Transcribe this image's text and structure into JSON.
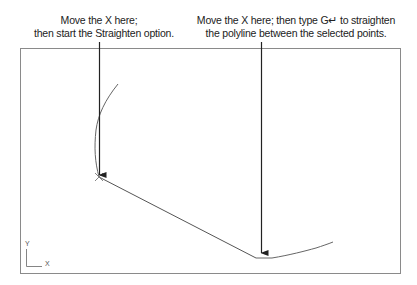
{
  "callouts": {
    "left": {
      "line1": "Move the X here;",
      "line2": "then start the Straighten option."
    },
    "right": {
      "line1": "Move the X here; then type G↵ to straighten",
      "line2": "the polyline between the selected points."
    }
  },
  "ucs_icon": {
    "y_label": "Y",
    "x_label": "X"
  },
  "colors": {
    "frame": "#8a8a8a",
    "polyline": "#555555",
    "arrow": "#222222"
  }
}
